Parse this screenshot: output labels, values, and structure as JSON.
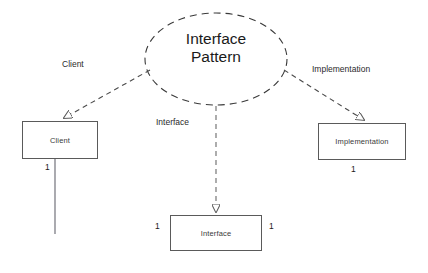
{
  "diagram": {
    "title": "Interface Pattern",
    "pattern": {
      "name_line1": "Interface",
      "name_line2": "Pattern"
    },
    "nodes": [
      {
        "id": "client",
        "label": "Client"
      },
      {
        "id": "implementation",
        "label": "Implementation"
      },
      {
        "id": "interface",
        "label": "Interface"
      }
    ],
    "role_labels": [
      {
        "id": "role-client",
        "text": "Client"
      },
      {
        "id": "role-interface",
        "text": "Interface"
      },
      {
        "id": "role-implementation",
        "text": "Implementation"
      }
    ],
    "multiplicities": [
      {
        "id": "mult-client-bottom",
        "text": "1"
      },
      {
        "id": "mult-implementation-bottom",
        "text": "1"
      },
      {
        "id": "mult-interface-left",
        "text": "1"
      },
      {
        "id": "mult-interface-right",
        "text": "1"
      }
    ],
    "colors": {
      "stroke": "#5a5a5a",
      "text": "#1a1a1a",
      "association_left_start": "#8a8a8a",
      "association_left_end": "#3fd6a0",
      "association_right": "#6b5a6b",
      "background": "#ffffff"
    }
  }
}
